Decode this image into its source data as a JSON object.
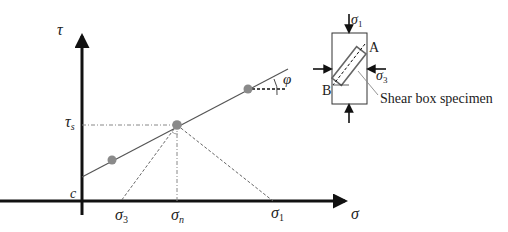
{
  "diagram": {
    "type": "Mohr-Coulomb failure envelope with shear box schematic",
    "axes": {
      "x_label": "σ",
      "y_label": "τ"
    },
    "labels": {
      "cohesion": "c",
      "shear_stress": "τ",
      "shear_stress_sub": "s",
      "friction_angle": "φ",
      "sigma3": "σ",
      "sigma3_sub": "3",
      "sigman": "σ",
      "sigman_sub": "n",
      "sigma1": "σ",
      "sigma1_sub": "1"
    },
    "data_points": [
      {
        "name": "point-1",
        "color": "#8a8a8a"
      },
      {
        "name": "point-2",
        "color": "#8a8a8a"
      },
      {
        "name": "point-3",
        "color": "#8a8a8a"
      }
    ],
    "inset": {
      "top_stress": "σ",
      "top_stress_sub": "1",
      "side_stress": "σ",
      "side_stress_sub": "3",
      "corner_a": "A",
      "corner_b": "B",
      "specimen_label": "Shear box specimen"
    }
  }
}
